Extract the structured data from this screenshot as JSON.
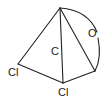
{
  "diagram": {
    "type": "molecular-structure",
    "atoms": [
      {
        "id": "apex",
        "label": "",
        "x": 60,
        "y": 8
      },
      {
        "id": "cl_left",
        "label": "Cl",
        "x": 18,
        "y": 64
      },
      {
        "id": "cl_bottom",
        "label": "Cl",
        "x": 63,
        "y": 83
      },
      {
        "id": "right",
        "label": "",
        "x": 95,
        "y": 71
      }
    ],
    "labels": {
      "center_c": "C",
      "oxygen": "O",
      "cl_left": "Cl",
      "cl_bottom": "Cl"
    },
    "bonds": [
      [
        "apex",
        "cl_left"
      ],
      [
        "apex",
        "cl_bottom"
      ],
      [
        "apex",
        "right"
      ],
      [
        "cl_left",
        "cl_bottom"
      ],
      [
        "cl_bottom",
        "right"
      ]
    ],
    "arcs": [
      {
        "from": "apex",
        "to": "right",
        "via_label": "O"
      }
    ],
    "colors": {
      "line": "#222222",
      "background": "#ffffff"
    }
  }
}
